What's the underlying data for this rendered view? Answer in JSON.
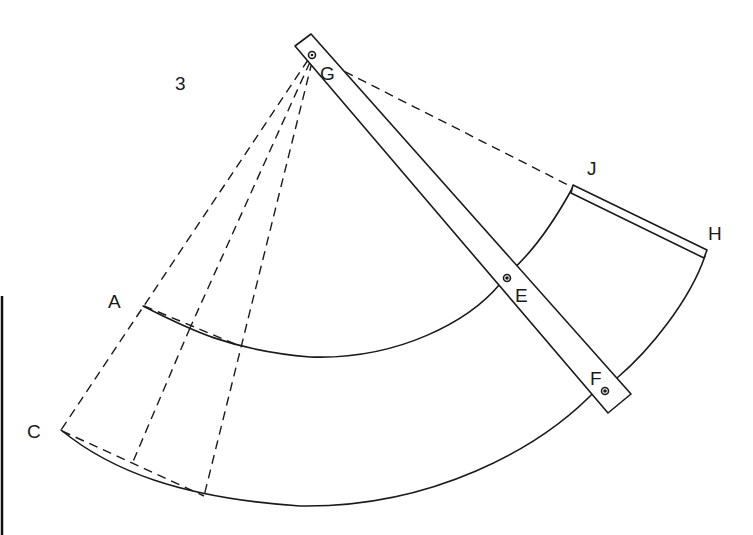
{
  "figure": {
    "number": "3",
    "point_labels": {
      "A": "A",
      "C": "C",
      "E": "E",
      "F": "F",
      "G": "G",
      "H": "H",
      "J": "J"
    },
    "elements": [
      {
        "id": "trammel-bar",
        "type": "rectangular strip",
        "pivots": [
          "G",
          "E",
          "F"
        ]
      },
      {
        "id": "inner-arc",
        "from": "A",
        "to": "E",
        "style": "solid"
      },
      {
        "id": "outer-arc",
        "from": "C",
        "to": "F",
        "style": "solid"
      },
      {
        "id": "end-band",
        "from": "J",
        "to": "H",
        "style": "double line"
      },
      {
        "id": "right-arc",
        "from": "H",
        "to": "F",
        "style": "solid"
      },
      {
        "id": "radial-lines",
        "origin": "G",
        "style": "dashed",
        "count": 3
      },
      {
        "id": "chord-lines",
        "style": "dashed",
        "segments": [
          "A-inner",
          "C-outer"
        ]
      },
      {
        "id": "line-G-J",
        "style": "dashed"
      }
    ]
  },
  "colors": {
    "ink": "#1a1a1a",
    "background": "#ffffff"
  }
}
